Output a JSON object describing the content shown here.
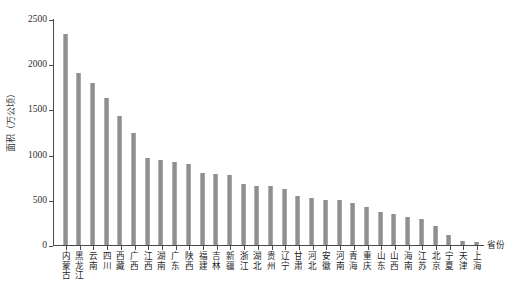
{
  "chart_data": {
    "type": "bar",
    "title": "",
    "xlabel": "省份",
    "ylabel": "面积（万公顷）",
    "ylim": [
      0,
      2500
    ],
    "yticks": [
      0,
      500,
      1000,
      1500,
      2000,
      2500
    ],
    "grid": false,
    "legend": null,
    "bar_color": "#8f8f8f",
    "axis_color": "#4a4a4a",
    "categories": [
      "内蒙古",
      "黑龙江",
      "云南",
      "四川",
      "西藏",
      "广西",
      "江西",
      "湖南",
      "广东",
      "陕西",
      "福建",
      "吉林",
      "新疆",
      "浙江",
      "湖北",
      "贵州",
      "辽宁",
      "甘肃",
      "河北",
      "安徽",
      "河南",
      "青海",
      "重庆",
      "山东",
      "山西",
      "海南",
      "江苏",
      "北京",
      "宁夏",
      "天津",
      "上海"
    ],
    "values": [
      2340,
      1915,
      1795,
      1635,
      1430,
      1245,
      965,
      940,
      920,
      900,
      800,
      785,
      780,
      680,
      655,
      655,
      620,
      545,
      525,
      505,
      495,
      465,
      420,
      365,
      350,
      310,
      290,
      215,
      110,
      50,
      30
    ]
  },
  "axis": {
    "y_title": "面积（万公顷）",
    "x_title": "省份"
  }
}
